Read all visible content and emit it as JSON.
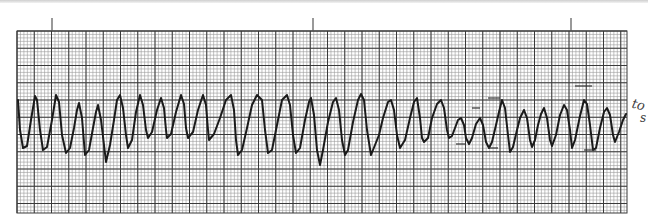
{
  "strip": {
    "paper_color": "#ffffff",
    "minor_grid_color": "#9a9a9a",
    "major_grid_color": "#3a3a3a",
    "trace_color": "#1a1a1a",
    "grid_box": {
      "x": 17,
      "y": 31,
      "width": 610,
      "height": 182
    },
    "minor_step": 3.45,
    "major_step": 17.25,
    "time_marks_x": [
      52,
      313,
      571
    ],
    "time_mark_top": 18,
    "trace_points": [
      [
        18,
        100
      ],
      [
        20,
        130
      ],
      [
        23,
        148
      ],
      [
        27,
        146
      ],
      [
        31,
        120
      ],
      [
        35,
        96
      ],
      [
        37,
        100
      ],
      [
        40,
        130
      ],
      [
        43,
        150
      ],
      [
        47,
        147
      ],
      [
        52,
        120
      ],
      [
        56,
        95
      ],
      [
        59,
        102
      ],
      [
        62,
        135
      ],
      [
        66,
        153
      ],
      [
        70,
        148
      ],
      [
        74,
        128
      ],
      [
        77,
        110
      ],
      [
        79,
        103
      ],
      [
        82,
        118
      ],
      [
        85,
        155
      ],
      [
        89,
        150
      ],
      [
        93,
        128
      ],
      [
        96,
        112
      ],
      [
        98,
        105
      ],
      [
        101,
        120
      ],
      [
        104,
        145
      ],
      [
        106,
        162
      ],
      [
        110,
        145
      ],
      [
        114,
        120
      ],
      [
        117,
        100
      ],
      [
        120,
        95
      ],
      [
        123,
        108
      ],
      [
        126,
        135
      ],
      [
        128,
        148
      ],
      [
        132,
        140
      ],
      [
        136,
        112
      ],
      [
        140,
        95
      ],
      [
        143,
        105
      ],
      [
        146,
        130
      ],
      [
        148,
        138
      ],
      [
        152,
        132
      ],
      [
        157,
        110
      ],
      [
        161,
        98
      ],
      [
        164,
        108
      ],
      [
        166,
        130
      ],
      [
        167,
        138
      ],
      [
        171,
        134
      ],
      [
        176,
        112
      ],
      [
        181,
        95
      ],
      [
        184,
        104
      ],
      [
        186,
        128
      ],
      [
        188,
        138
      ],
      [
        193,
        132
      ],
      [
        198,
        110
      ],
      [
        203,
        95
      ],
      [
        206,
        105
      ],
      [
        208,
        130
      ],
      [
        209,
        140
      ],
      [
        214,
        134
      ],
      [
        220,
        118
      ],
      [
        226,
        100
      ],
      [
        231,
        95
      ],
      [
        234,
        110
      ],
      [
        236,
        140
      ],
      [
        238,
        155
      ],
      [
        242,
        150
      ],
      [
        247,
        128
      ],
      [
        252,
        105
      ],
      [
        257,
        95
      ],
      [
        262,
        100
      ],
      [
        265,
        130
      ],
      [
        268,
        153
      ],
      [
        272,
        150
      ],
      [
        277,
        125
      ],
      [
        282,
        100
      ],
      [
        287,
        95
      ],
      [
        290,
        105
      ],
      [
        293,
        135
      ],
      [
        296,
        153
      ],
      [
        300,
        148
      ],
      [
        305,
        120
      ],
      [
        309,
        102
      ],
      [
        311,
        98
      ],
      [
        314,
        115
      ],
      [
        317,
        150
      ],
      [
        320,
        165
      ],
      [
        323,
        150
      ],
      [
        328,
        122
      ],
      [
        333,
        102
      ],
      [
        336,
        98
      ],
      [
        339,
        110
      ],
      [
        342,
        140
      ],
      [
        345,
        155
      ],
      [
        348,
        150
      ],
      [
        353,
        122
      ],
      [
        358,
        100
      ],
      [
        361,
        94
      ],
      [
        364,
        100
      ],
      [
        367,
        130
      ],
      [
        371,
        155
      ],
      [
        375,
        145
      ],
      [
        379,
        135
      ],
      [
        383,
        118
      ],
      [
        388,
        102
      ],
      [
        391,
        100
      ],
      [
        394,
        110
      ],
      [
        397,
        135
      ],
      [
        400,
        148
      ],
      [
        405,
        140
      ],
      [
        410,
        118
      ],
      [
        414,
        102
      ],
      [
        417,
        98
      ],
      [
        420,
        118
      ],
      [
        422,
        138
      ],
      [
        424,
        142
      ],
      [
        428,
        138
      ],
      [
        432,
        118
      ],
      [
        437,
        104
      ],
      [
        441,
        100
      ],
      [
        444,
        108
      ],
      [
        447,
        130
      ],
      [
        449,
        138
      ],
      [
        452,
        136
      ],
      [
        455,
        128
      ],
      [
        458,
        120
      ],
      [
        461,
        118
      ],
      [
        464,
        125
      ],
      [
        466,
        138
      ],
      [
        469,
        144
      ],
      [
        472,
        138
      ],
      [
        476,
        124
      ],
      [
        480,
        118
      ],
      [
        483,
        125
      ],
      [
        486,
        142
      ],
      [
        489,
        148
      ],
      [
        492,
        142
      ],
      [
        496,
        125
      ],
      [
        499,
        112
      ],
      [
        502,
        100
      ],
      [
        505,
        108
      ],
      [
        508,
        135
      ],
      [
        510,
        152
      ],
      [
        513,
        147
      ],
      [
        517,
        130
      ],
      [
        520,
        118
      ],
      [
        524,
        110
      ],
      [
        527,
        118
      ],
      [
        530,
        140
      ],
      [
        532,
        147
      ],
      [
        535,
        140
      ],
      [
        538,
        125
      ],
      [
        541,
        114
      ],
      [
        544,
        108
      ],
      [
        547,
        118
      ],
      [
        550,
        140
      ],
      [
        552,
        146
      ],
      [
        556,
        135
      ],
      [
        560,
        115
      ],
      [
        564,
        105
      ],
      [
        567,
        110
      ],
      [
        570,
        130
      ],
      [
        572,
        148
      ],
      [
        575,
        140
      ],
      [
        580,
        116
      ],
      [
        584,
        100
      ],
      [
        587,
        104
      ],
      [
        590,
        125
      ],
      [
        593,
        150
      ],
      [
        596,
        148
      ],
      [
        600,
        128
      ],
      [
        604,
        112
      ],
      [
        607,
        108
      ],
      [
        610,
        115
      ],
      [
        613,
        135
      ],
      [
        615,
        142
      ],
      [
        619,
        132
      ],
      [
        623,
        120
      ],
      [
        626,
        114
      ]
    ],
    "handwritten_marks": [
      {
        "x1": 472,
        "y1": 108,
        "x2": 480,
        "y2": 108
      },
      {
        "x1": 488,
        "y1": 98,
        "x2": 500,
        "y2": 98
      },
      {
        "x1": 488,
        "y1": 148,
        "x2": 498,
        "y2": 148
      },
      {
        "x1": 456,
        "y1": 144,
        "x2": 466,
        "y2": 144
      },
      {
        "x1": 575,
        "y1": 86,
        "x2": 592,
        "y2": 86
      },
      {
        "x1": 584,
        "y1": 150,
        "x2": 596,
        "y2": 150
      }
    ]
  },
  "annotations": {
    "line1": "to",
    "line2": "s"
  }
}
